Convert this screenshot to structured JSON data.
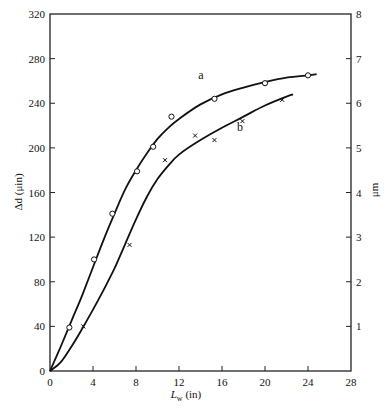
{
  "chart_data": {
    "type": "line",
    "title": "",
    "xlabel": "L_w (in)",
    "xlabel_main": "L",
    "xlabel_sub": "w",
    "xlabel_unit": "(in)",
    "ylabel": "Δd (μin)",
    "ylabel_right": "μm",
    "xlim": [
      0,
      28
    ],
    "ylim": [
      0,
      320
    ],
    "ylim_right": [
      0,
      8
    ],
    "xticks": [
      0,
      4,
      8,
      12,
      16,
      20,
      24,
      28
    ],
    "yticks": [
      0,
      40,
      80,
      120,
      160,
      200,
      240,
      280,
      320
    ],
    "yticks_right": [
      1,
      2,
      3,
      4,
      5,
      6,
      7,
      8
    ],
    "grid": false,
    "legend": "inline labels",
    "series": [
      {
        "name": "a",
        "marker": "circle",
        "points": [
          [
            1.8,
            39
          ],
          [
            4.1,
            100
          ],
          [
            5.8,
            141
          ],
          [
            8.1,
            179
          ],
          [
            9.6,
            201
          ],
          [
            11.3,
            228
          ],
          [
            15.3,
            244
          ],
          [
            20.0,
            258
          ],
          [
            24.0,
            265
          ]
        ],
        "curve": [
          [
            0,
            0
          ],
          [
            1,
            22
          ],
          [
            2,
            45
          ],
          [
            3,
            68
          ],
          [
            4,
            93
          ],
          [
            5,
            118
          ],
          [
            6,
            141
          ],
          [
            7,
            163
          ],
          [
            8,
            180
          ],
          [
            9,
            195
          ],
          [
            10,
            208
          ],
          [
            11,
            218
          ],
          [
            12,
            226
          ],
          [
            14,
            239
          ],
          [
            16,
            248
          ],
          [
            18,
            254
          ],
          [
            20,
            259
          ],
          [
            22,
            263
          ],
          [
            24,
            265
          ],
          [
            24.8,
            266
          ]
        ]
      },
      {
        "name": "b",
        "marker": "cross",
        "points": [
          [
            3.1,
            40
          ],
          [
            7.4,
            113
          ],
          [
            10.7,
            189
          ],
          [
            13.5,
            211
          ],
          [
            15.3,
            207
          ],
          [
            17.9,
            224
          ],
          [
            21.6,
            243
          ]
        ],
        "curve": [
          [
            0,
            0
          ],
          [
            1,
            8
          ],
          [
            2,
            22
          ],
          [
            3,
            38
          ],
          [
            4,
            55
          ],
          [
            5,
            73
          ],
          [
            6,
            92
          ],
          [
            7,
            114
          ],
          [
            8,
            136
          ],
          [
            9,
            156
          ],
          [
            10,
            172
          ],
          [
            11,
            184
          ],
          [
            12,
            194
          ],
          [
            14,
            207
          ],
          [
            16,
            218
          ],
          [
            18,
            228
          ],
          [
            20,
            238
          ],
          [
            22,
            246
          ],
          [
            22.6,
            248
          ]
        ]
      }
    ],
    "series_label_positions": {
      "a": [
        13.8,
        262
      ],
      "b": [
        17.4,
        215
      ]
    }
  }
}
